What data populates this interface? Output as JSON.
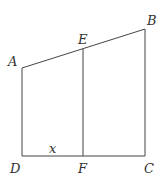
{
  "diagram": {
    "type": "geometry-figure",
    "points": {
      "A": {
        "x": 22,
        "y": 68
      },
      "B": {
        "x": 145,
        "y": 29
      },
      "C": {
        "x": 145,
        "y": 156
      },
      "D": {
        "x": 22,
        "y": 156
      },
      "E": {
        "x": 83,
        "y": 49
      },
      "F": {
        "x": 83,
        "y": 156
      }
    },
    "labels": {
      "A": "A",
      "B": "B",
      "C": "C",
      "D": "D",
      "E": "E",
      "F": "F",
      "x": "x"
    },
    "segments": [
      [
        "A",
        "B"
      ],
      [
        "B",
        "C"
      ],
      [
        "C",
        "D"
      ],
      [
        "D",
        "A"
      ],
      [
        "E",
        "F"
      ]
    ],
    "stroke_color": "#444444",
    "label_color": "#333333"
  }
}
